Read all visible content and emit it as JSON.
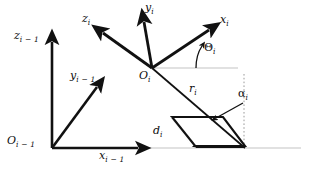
{
  "figure": {
    "type": "diagram",
    "background_color": "#ffffff",
    "stroke_color": "#111111",
    "guide_color": "#b9b9b9"
  },
  "labels": {
    "z_prev": {
      "base": "z",
      "sub": "i − 1",
      "x": 14,
      "y": 36
    },
    "o_prev": {
      "base": "O",
      "sub": "i − 1",
      "x": 9,
      "y": 141
    },
    "x_prev": {
      "base": "x",
      "sub": "i − 1",
      "x": 101,
      "y": 153
    },
    "y_prev": {
      "base": "y",
      "sub": "i − 1",
      "x": 71,
      "y": 73
    },
    "z_cur": {
      "base": "z",
      "sub": "i",
      "x": 83,
      "y": 18
    },
    "y_cur": {
      "base": "y",
      "sub": "i",
      "x": 146,
      "y": 6
    },
    "x_cur": {
      "base": "x",
      "sub": "i",
      "x": 221,
      "y": 19
    },
    "o_cur": {
      "base": "O",
      "sub": "i",
      "x": 140,
      "y": 74
    },
    "theta": {
      "base": "Θ",
      "sub": "i",
      "x": 205,
      "y": 46
    },
    "r": {
      "base": "r",
      "sub": "i",
      "x": 190,
      "y": 87
    },
    "alpha": {
      "base": "α",
      "sub": "i",
      "x": 240,
      "y": 93
    },
    "d": {
      "base": "d",
      "sub": "i",
      "x": 154,
      "y": 128
    }
  },
  "geometry": {
    "origin_prev": {
      "x": 52,
      "y": 148
    },
    "origin_cur": {
      "x": 152,
      "y": 68
    },
    "axes_prev": [
      {
        "name": "z-axis-previous",
        "x2": 52,
        "y2": 36
      },
      {
        "name": "x-axis-previous",
        "x2": 146,
        "y2": 148
      },
      {
        "name": "y-axis-previous",
        "x2": 100,
        "y2": 82
      }
    ],
    "axes_cur": [
      {
        "name": "z-axis-current",
        "x2": 98,
        "y2": 28
      },
      {
        "name": "y-axis-current",
        "x2": 143,
        "y2": 16
      },
      {
        "name": "x-axis-current",
        "x2": 214,
        "y2": 26
      }
    ],
    "link_offset_line": {
      "x1": 52,
      "y1": 148,
      "x2": 244,
      "y2": 148
    },
    "common_normal": {
      "x1": 152,
      "y1": 68,
      "x2": 245,
      "y2": 148
    },
    "vertical_dashed": {
      "x": 244,
      "y1": 76,
      "y2": 148
    },
    "theta_ref_line": {
      "x1": 152,
      "y1": 68,
      "x2": 237,
      "y2": 68
    }
  }
}
